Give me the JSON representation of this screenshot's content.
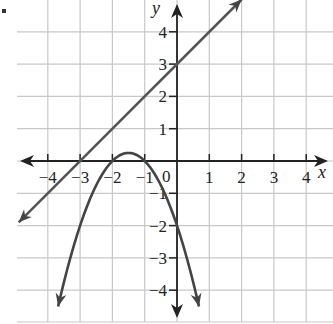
{
  "chart_data": {
    "type": "line",
    "title": "",
    "xlabel": "x",
    "ylabel": "y",
    "xlim": [
      -4.5,
      4.5
    ],
    "ylim": [
      -4.5,
      4.5
    ],
    "grid": true,
    "origin_label": "0",
    "x_ticks": [
      -4,
      -3,
      -2,
      -1,
      1,
      2,
      3,
      4
    ],
    "y_ticks": [
      -4,
      -3,
      -2,
      -1,
      1,
      2,
      3,
      4
    ],
    "x_tick_labels": [
      "−4",
      "−3",
      "−2",
      "−1",
      "1",
      "2",
      "3",
      "4"
    ],
    "y_tick_labels": [
      "−4",
      "−3",
      "−2",
      "−1",
      "1",
      "2",
      "3",
      "4"
    ],
    "series": [
      {
        "name": "line",
        "equation": "y = x + 3",
        "x": [
          -4.9,
          -4,
          -3,
          -2,
          -1,
          0,
          1,
          2
        ],
        "y": [
          -1.9,
          -1,
          0,
          1,
          2,
          3,
          4,
          5
        ]
      },
      {
        "name": "parabola",
        "equation": "y = -(x+1)(x+2)",
        "vertex": [
          -1.5,
          0.25
        ],
        "x_intercepts": [
          -2,
          -1
        ],
        "y_intercept": -2,
        "x": [
          -3.7,
          -3,
          -2.5,
          -2,
          -1.5,
          -1,
          -0.5,
          0,
          0.7
        ],
        "y": [
          -4.9,
          -2,
          -0.75,
          0,
          0.25,
          0,
          -0.75,
          -2,
          -4.9
        ]
      }
    ]
  },
  "marker": "▪"
}
